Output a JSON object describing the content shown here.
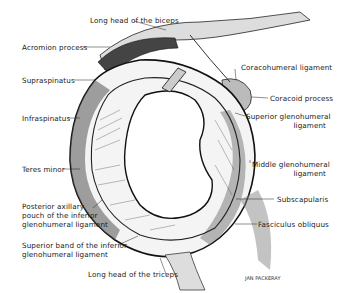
{
  "figure": {
    "signature": "JAN PACKERAY",
    "labels": {
      "long_head_biceps": "Long head of the biceps",
      "acromion": "Acromion process",
      "supraspinatus": "Supraspinatus",
      "infraspinatus": "Infraspinatus",
      "teres_minor": "Teres minor",
      "posterior_pouch_1": "Posterior axillary",
      "posterior_pouch_2": "pouch of the inferior",
      "posterior_pouch_3": "glenohumeral ligament",
      "superior_band_1": "Superior band of the inferior",
      "superior_band_2": "glenohumeral ligament",
      "long_head_triceps": "Long head of the triceps",
      "coracohumeral": "Coracohumeral ligament",
      "coracoid": "Coracoid process",
      "superior_gh_1": "Superior glenohumeral",
      "superior_gh_2": "ligament",
      "middle_gh_1": "Middle glenohumeral",
      "middle_gh_2": "ligament",
      "subscapularis": "Subscapularis",
      "fasciculus": "Fasciculus obliquus"
    }
  }
}
